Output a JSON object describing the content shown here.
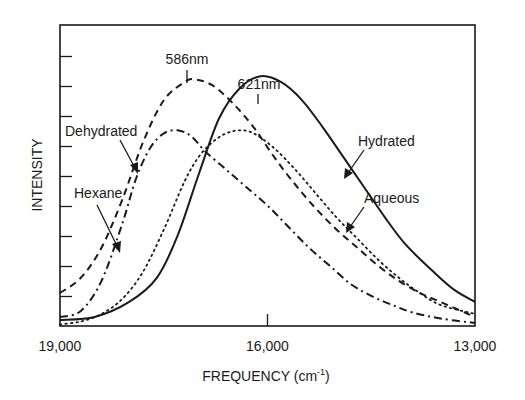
{
  "chart_data": {
    "type": "line",
    "title": "",
    "xlabel": "FREQUENCY (cm-1)",
    "xlabel_main": "FREQUENCY (cm",
    "xlabel_sup": "-1",
    "xlabel_close": ")",
    "ylabel": "INTENSITY",
    "xlim": [
      19000,
      13000
    ],
    "x_reversed": true,
    "ylim": [
      0,
      10
    ],
    "x_ticks": [
      {
        "value": 19000,
        "label": "19,000"
      },
      {
        "value": 16000,
        "label": "16,000"
      },
      {
        "value": 13000,
        "label": "13,000"
      }
    ],
    "y_ticks_count": 9,
    "y_tick_labels": [],
    "grid": false,
    "legend": "inline annotations with arrows",
    "annotations": [
      {
        "text": "586nm",
        "x": 17065,
        "note": "peak of Dehydrated curve"
      },
      {
        "text": "621nm",
        "x": 16100,
        "note": "peak of Hydrated curve"
      },
      {
        "text": "Dehydrated",
        "target": "Dehydrated"
      },
      {
        "text": "Hexane",
        "target": "Hexane"
      },
      {
        "text": "Hydrated",
        "target": "Hydrated"
      },
      {
        "text": "Aqueous",
        "target": "Aqueous"
      }
    ],
    "series": [
      {
        "name": "Hydrated",
        "style": "solid",
        "x": [
          19000,
          18500,
          18000,
          17600,
          17300,
          17000,
          16700,
          16400,
          16100,
          15800,
          15500,
          15200,
          14900,
          14600,
          14300,
          14000,
          13600,
          13300,
          13000
        ],
        "y": [
          0.2,
          0.3,
          0.8,
          1.6,
          3.0,
          5.0,
          6.9,
          7.9,
          8.3,
          8.1,
          7.5,
          6.6,
          5.6,
          4.6,
          3.6,
          2.7,
          1.8,
          1.2,
          0.8
        ]
      },
      {
        "name": "Dehydrated",
        "style": "dashed",
        "x": [
          19000,
          18700,
          18400,
          18100,
          17800,
          17500,
          17200,
          17065,
          16800,
          16500,
          16200,
          15900,
          15600,
          15300,
          15000,
          14700,
          14400,
          14100,
          13800,
          13500,
          13000
        ],
        "y": [
          1.1,
          1.6,
          2.6,
          4.2,
          6.1,
          7.5,
          8.1,
          8.2,
          8.0,
          7.4,
          6.6,
          5.6,
          4.7,
          3.9,
          3.2,
          2.6,
          2.0,
          1.5,
          1.1,
          0.8,
          0.3
        ]
      },
      {
        "name": "Hexane",
        "style": "dashdot",
        "x": [
          19000,
          18700,
          18400,
          18100,
          17900,
          17700,
          17500,
          17300,
          17100,
          16900,
          16600,
          16300,
          16000,
          15700,
          15400,
          15100,
          14800,
          14500,
          14200,
          13900,
          13500,
          13000
        ],
        "y": [
          0.3,
          0.5,
          1.5,
          3.4,
          4.9,
          5.9,
          6.4,
          6.5,
          6.3,
          5.8,
          5.2,
          4.6,
          4.0,
          3.3,
          2.6,
          2.0,
          1.4,
          1.0,
          0.7,
          0.45,
          0.25,
          0.1
        ]
      },
      {
        "name": "Aqueous",
        "style": "dotted",
        "x": [
          19000,
          18700,
          18400,
          18100,
          17800,
          17500,
          17200,
          17000,
          16800,
          16600,
          16400,
          16200,
          15900,
          15600,
          15300,
          15000,
          14700,
          14400,
          14100,
          13800,
          13500,
          13000
        ],
        "y": [
          0.05,
          0.15,
          0.4,
          0.9,
          1.8,
          3.2,
          4.8,
          5.6,
          6.1,
          6.4,
          6.5,
          6.4,
          5.9,
          5.2,
          4.4,
          3.6,
          2.9,
          2.2,
          1.6,
          1.1,
          0.7,
          0.4
        ]
      }
    ]
  }
}
